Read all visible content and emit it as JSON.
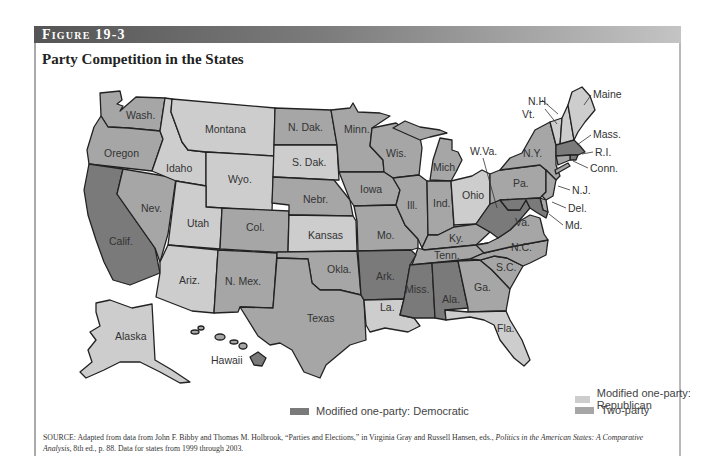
{
  "header": {
    "figure_label": "Figure 19-3"
  },
  "title": "Party Competition in the States",
  "legend": {
    "republican": {
      "label": "Modified one-party: Republican",
      "color": "#cdcdcd"
    },
    "two_party": {
      "label": "Two-party",
      "color": "#a6a6a6"
    },
    "democratic": {
      "label": "Modified one-party: Democratic",
      "color": "#7a7a7a"
    }
  },
  "source": {
    "prefix": "SOURCE: Adapted from data from John F. Bibby and Thomas M. Holbrook, “Parties and Elections,” in Virginia Gray and Russell Hansen, eds., ",
    "italic": "Politics in the American States: A Comparative Analysis,",
    "suffix": " 8th ed., p. 88. Data for states from 1999 through 2003."
  },
  "map": {
    "categories": {
      "democratic": [
        "Calif.",
        "Ark.",
        "Miss.",
        "Ala.",
        "W.Va.",
        "Mass.",
        "R.I.",
        "Md.",
        "Hawaii"
      ],
      "republican": [
        "Montana",
        "Idaho",
        "Wyo.",
        "Utah",
        "Ariz.",
        "S. Dak.",
        "Kansas",
        "Ohio",
        "Alaska",
        "Fla.",
        "Vt.",
        "N.H.",
        "Maine",
        "La."
      ],
      "two_party": [
        "Wash.",
        "Oregon",
        "Nev.",
        "Col.",
        "N. Mex.",
        "N. Dak.",
        "Nebr.",
        "Okla.",
        "Texas",
        "Minn.",
        "Iowa",
        "Mo.",
        "Wis.",
        "Ill.",
        "Mich.",
        "Ind.",
        "Ky.",
        "Tenn.",
        "Ga.",
        "S.C.",
        "N.C.",
        "Va.",
        "Pa.",
        "N.Y.",
        "N.J.",
        "Del.",
        "Conn."
      ]
    },
    "labels": {
      "wash": "Wash.",
      "oregon": "Oregon",
      "calif": "Calif.",
      "nev": "Nev.",
      "idaho": "Idaho",
      "montana": "Montana",
      "wyo": "Wyo.",
      "utah": "Utah",
      "ariz": "Ariz.",
      "col": "Col.",
      "nmex": "N. Mex.",
      "ndak": "N. Dak.",
      "sdak": "S. Dak.",
      "nebr": "Nebr.",
      "kansas": "Kansas",
      "okla": "Okla.",
      "texas": "Texas",
      "minn": "Minn.",
      "iowa": "Iowa",
      "mo": "Mo.",
      "ark": "Ark.",
      "la": "La.",
      "wis": "Wis.",
      "ill": "Ill.",
      "mich": "Mich.",
      "ind": "Ind.",
      "ohio": "Ohio",
      "ky": "Ky.",
      "tenn": "Tenn.",
      "miss": "Miss.",
      "ala": "Ala.",
      "ga": "Ga.",
      "fla": "Fla.",
      "sc": "S.C.",
      "nc": "N.C.",
      "va": "Va.",
      "wva": "W.Va.",
      "pa": "Pa.",
      "ny": "N.Y.",
      "vt": "Vt.",
      "nh": "N.H.",
      "maine": "Maine",
      "mass": "Mass.",
      "ri": "R.I.",
      "conn": "Conn.",
      "nj": "N.J.",
      "del": "Del.",
      "md": "Md.",
      "alaska": "Alaska",
      "hawaii": "Hawaii"
    }
  }
}
